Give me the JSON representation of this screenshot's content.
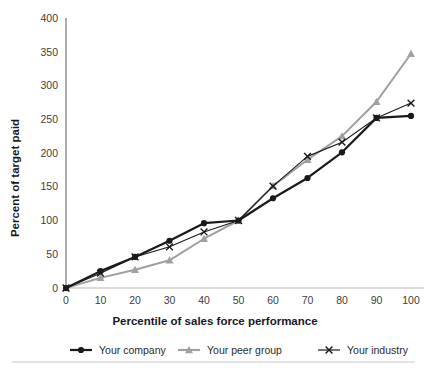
{
  "chart_data": {
    "type": "line",
    "title": "",
    "xlabel": "Percentile of sales force performance",
    "ylabel": "Percent of target paid",
    "x": [
      0,
      10,
      20,
      30,
      40,
      50,
      60,
      70,
      80,
      90,
      100
    ],
    "xticklabels": [
      "0",
      "10",
      "20",
      "30",
      "40",
      "50",
      "60",
      "70",
      "80",
      "90",
      "100"
    ],
    "yticklabels": [
      "0",
      "50",
      "100",
      "150",
      "200",
      "250",
      "300",
      "350",
      "400"
    ],
    "yticks": [
      0,
      50,
      100,
      150,
      200,
      250,
      300,
      350,
      400
    ],
    "xlim": [
      0,
      100
    ],
    "ylim": [
      0,
      400
    ],
    "grid": false,
    "legend_position": "bottom",
    "series": [
      {
        "name": "Your company",
        "color": "#1a1a1a",
        "marker": "circle",
        "values": [
          0,
          25,
          46,
          70,
          96,
          100,
          133,
          163,
          201,
          252,
          255
        ]
      },
      {
        "name": "Your peer group",
        "color": "#a0a0a0",
        "marker": "triangle",
        "values": [
          0,
          15,
          27,
          41,
          73,
          100,
          151,
          190,
          225,
          276,
          347
        ]
      },
      {
        "name": "Your industry",
        "color": "#1a1a1a",
        "marker": "x",
        "values": [
          0,
          22,
          46,
          61,
          83,
          100,
          151,
          195,
          216,
          252,
          274
        ]
      }
    ]
  },
  "legend": {
    "items": [
      {
        "label": "Your company",
        "icon": "line-circle-marker-icon"
      },
      {
        "label": "Your peer group",
        "icon": "line-triangle-marker-icon"
      },
      {
        "label": "Your industry",
        "icon": "line-x-marker-icon"
      }
    ]
  },
  "axes": {
    "x_title": "Percentile of sales force performance",
    "y_title": "Percent of target paid"
  },
  "colors": {
    "company": "#1a1a1a",
    "peer_group": "#a0a0a0",
    "industry": "#1a1a1a",
    "axis": "#808080",
    "background": "#ffffff",
    "divider": "#c8c8d0"
  }
}
